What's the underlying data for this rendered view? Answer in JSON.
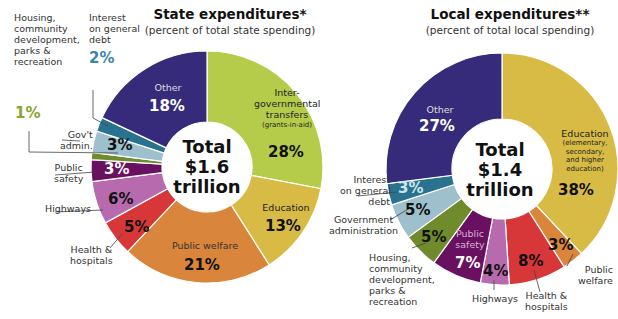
{
  "chart_data": [
    {
      "type": "pie",
      "title": "State expenditures*",
      "subtitle": "(percent of total state spending)",
      "center_label": [
        "Total",
        "$1.6",
        "trillion"
      ],
      "slices": [
        {
          "label": "Inter-governmental transfers (grants-in-aid)",
          "value": 28,
          "color": "#b5cc4a"
        },
        {
          "label": "Education",
          "value": 13,
          "color": "#d8bb45"
        },
        {
          "label": "Public welfare",
          "value": 21,
          "color": "#d9853b"
        },
        {
          "label": "Health & hospitals",
          "value": 5,
          "color": "#d8373a"
        },
        {
          "label": "Highways",
          "value": 6,
          "color": "#b86aae"
        },
        {
          "label": "Public safety",
          "value": 3,
          "color": "#6a1060"
        },
        {
          "label": "Housing, community development, parks & recreation",
          "value": 1,
          "color": "#6f8b2c"
        },
        {
          "label": "Gov't admin.",
          "value": 3,
          "color": "#9ebfcc"
        },
        {
          "label": "Interest on general debt",
          "value": 2,
          "color": "#2a7390"
        },
        {
          "label": "Other",
          "value": 18,
          "color": "#352b7a"
        }
      ]
    },
    {
      "type": "pie",
      "title": "Local expenditures**",
      "subtitle": "(percent of total local spending)",
      "center_label": [
        "Total",
        "$1.4",
        "trillion"
      ],
      "slices": [
        {
          "label": "Education (elementary, secondary, and higher education)",
          "value": 38,
          "color": "#d8bb45"
        },
        {
          "label": "Public welfare",
          "value": 3,
          "color": "#d9853b"
        },
        {
          "label": "Health & hospitals",
          "value": 8,
          "color": "#d8373a"
        },
        {
          "label": "Highways",
          "value": 4,
          "color": "#b86aae"
        },
        {
          "label": "Public safety",
          "value": 7,
          "color": "#6a1060"
        },
        {
          "label": "Housing, community development, parks & recreation",
          "value": 5,
          "color": "#6f8b2c"
        },
        {
          "label": "Government administration",
          "value": 5,
          "color": "#9ebfcc"
        },
        {
          "label": "Interest on general debt",
          "value": 3,
          "color": "#2a7390"
        },
        {
          "label": "Other",
          "value": 27,
          "color": "#352b7a"
        }
      ]
    }
  ],
  "state": {
    "title": "State expenditures*",
    "subtitle": "(percent of total state spending)",
    "total": [
      "Total",
      "$1.6",
      "trillion"
    ],
    "labels": {
      "igt": [
        "Inter-",
        "governmental",
        "transfers"
      ],
      "igt_note": "(grants-in-aid)",
      "igt_pct": "28%",
      "edu": "Education",
      "edu_pct": "13%",
      "welfare": "Public welfare",
      "welfare_pct": "21%",
      "health": [
        "Health &",
        "hospitals"
      ],
      "health_pct": "5%",
      "highways": "Highways",
      "highways_pct": "6%",
      "safety": [
        "Public",
        "safety"
      ],
      "safety_pct": "3%",
      "housing": [
        "Housing,",
        "community",
        "development,",
        "parks &",
        "recreation"
      ],
      "housing_pct": "1%",
      "admin": [
        "Gov't",
        "admin."
      ],
      "admin_pct": "3%",
      "interest": [
        "Interest",
        "on general",
        "debt"
      ],
      "interest_pct": "2%",
      "other": "Other",
      "other_pct": "18%"
    }
  },
  "local": {
    "title": "Local expenditures**",
    "subtitle": "(percent of total local spending)",
    "total": [
      "Total",
      "$1.4",
      "trillion"
    ],
    "labels": {
      "edu": "Education",
      "edu_note": [
        "(elementary,",
        "secondary,",
        "and higher",
        "education)"
      ],
      "edu_pct": "38%",
      "welfare": [
        "Public",
        "welfare"
      ],
      "welfare_pct": "3%",
      "health": [
        "Health &",
        "hospitals"
      ],
      "health_pct": "8%",
      "highways": "Highways",
      "highways_pct": "4%",
      "safety": [
        "Public",
        "safety"
      ],
      "safety_pct": "7%",
      "housing": [
        "Housing,",
        "community",
        "development,",
        "parks &",
        "recreation"
      ],
      "housing_pct": "5%",
      "admin": [
        "Government",
        "administration"
      ],
      "admin_pct": "5%",
      "interest": [
        "Interest",
        "on general",
        "debt"
      ],
      "interest_pct": "3%",
      "other": "Other",
      "other_pct": "27%"
    }
  }
}
